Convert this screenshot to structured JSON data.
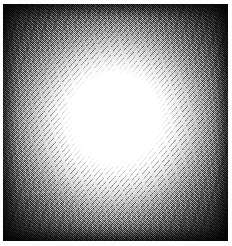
{
  "figure": {
    "kind": "grayscale-radial-glow",
    "title": "",
    "caption": "",
    "canvas": {
      "width": 232,
      "height": 246,
      "page_background": "#fdfdfd"
    },
    "plate": {
      "left": 3,
      "top": 4,
      "width": 225,
      "height": 237,
      "background_color": "#0b0b0b"
    },
    "glow": {
      "center_x": 115,
      "center_y": 122,
      "core_color": "#ffffff",
      "core_radius": 50,
      "midtone_color": "#808080",
      "midtone_radius": 78,
      "outer_color": "#0a0a0a",
      "outer_radius": 112
    },
    "rendering": {
      "dither": "on",
      "noise": "heavy",
      "vignette": "on"
    }
  },
  "chart_data": {
    "type": "heatmap",
    "title": "",
    "subtitle": "",
    "xlabel": "",
    "ylabel": "",
    "legend": [],
    "grid": false,
    "colormap": "grayscale",
    "value_range": [
      0,
      255
    ],
    "x": [
      0,
      10,
      20,
      30,
      40,
      50,
      60,
      70,
      80,
      90,
      100,
      110,
      120
    ],
    "radial_profile": {
      "radius_px": [
        0,
        10,
        20,
        30,
        40,
        50,
        60,
        70,
        80,
        90,
        100,
        110,
        120
      ],
      "gray_value": [
        255,
        255,
        255,
        255,
        255,
        252,
        214,
        160,
        110,
        66,
        34,
        16,
        9
      ]
    },
    "axis_ranges": {
      "radius_px": [
        0,
        120
      ],
      "gray_value": [
        0,
        255
      ]
    }
  }
}
